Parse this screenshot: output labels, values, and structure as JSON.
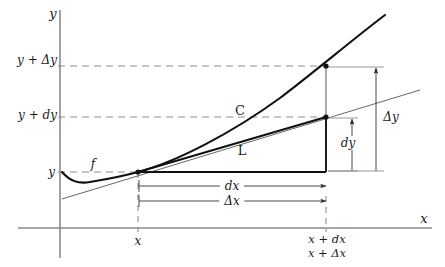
{
  "figure": {
    "kind": "calculus-differential-diagram",
    "background_color": "#ffffff",
    "ink_color": "#1a1a1a",
    "thin_color": "#555555",
    "dash_color": "#777777"
  },
  "axes": {
    "y_axis_label": "y",
    "x_axis_label": "x",
    "origin_px": {
      "x": 60,
      "y": 228
    }
  },
  "y_ticks": [
    {
      "id": "y-plus-delta-y",
      "label": "y + Δy",
      "y_px": 66
    },
    {
      "id": "y-plus-dy",
      "label": "y + dy",
      "y_px": 117
    },
    {
      "id": "y-base",
      "label": "y",
      "y_px": 172
    }
  ],
  "x_ticks": [
    {
      "id": "x-base",
      "lines": [
        "x"
      ],
      "x_px": 138
    },
    {
      "id": "x-plus-dx",
      "lines": [
        "x + dx",
        "x + Δx"
      ],
      "x_px": 327
    }
  ],
  "curve_labels": {
    "function_label": "f",
    "curve_label": "C",
    "tangent_label": "L"
  },
  "measures": [
    {
      "id": "dx",
      "label": "dx",
      "orientation": "horizontal",
      "from_px": 138,
      "to_px": 326,
      "at_px": 186
    },
    {
      "id": "delta-x",
      "label": "Δx",
      "orientation": "horizontal",
      "from_px": 138,
      "to_px": 326,
      "at_px": 201
    },
    {
      "id": "dy",
      "label": "dy",
      "orientation": "vertical",
      "from_px": 172,
      "to_px": 117,
      "at_px": 352
    },
    {
      "id": "delta-y",
      "label": "Δy",
      "orientation": "vertical",
      "from_px": 172,
      "to_px": 66,
      "at_px": 376
    }
  ],
  "points": [
    {
      "id": "tangency-point",
      "x_px": 138,
      "y_px": 172
    },
    {
      "id": "tangent-endpoint",
      "x_px": 326,
      "y_px": 117
    },
    {
      "id": "curve-endpoint",
      "x_px": 326,
      "y_px": 66
    }
  ]
}
